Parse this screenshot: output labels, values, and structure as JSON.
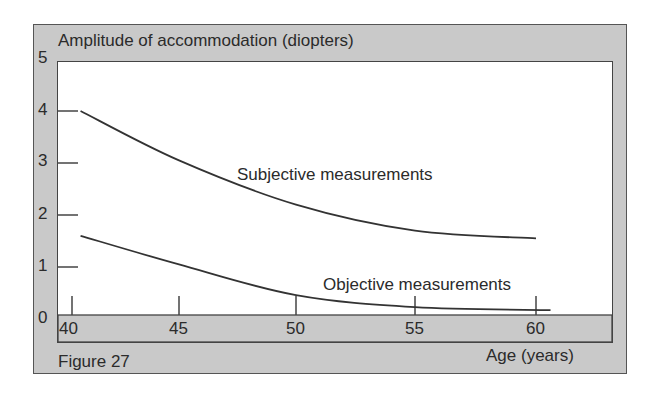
{
  "figure_label": "Figure 27",
  "colors": {
    "frame_gray": "#c9c9c9",
    "plot_white": "#ffffff",
    "ink": "#333333"
  },
  "chart_data": {
    "type": "line",
    "title": "Amplitude of accommodation (diopters)",
    "ylabel": "Amplitude of accommodation (diopters)",
    "xlabel": "Age (years)",
    "xlim": [
      40,
      62
    ],
    "ylim": [
      0,
      5
    ],
    "x_ticks": [
      40,
      45,
      50,
      55,
      60
    ],
    "y_ticks": [
      0,
      1,
      2,
      3,
      4,
      5
    ],
    "x_tick_labels": [
      "40",
      "45",
      "50",
      "55",
      "60"
    ],
    "y_tick_labels": [
      "0",
      "1",
      "2",
      "3",
      "4",
      "5"
    ],
    "grid": false,
    "legend": "inline annotations",
    "series": [
      {
        "name": "Subjective measurements",
        "x": [
          40.4,
          45,
          50,
          55,
          60
        ],
        "values": [
          4.0,
          3.05,
          2.2,
          1.7,
          1.55
        ]
      },
      {
        "name": "Objective measurements",
        "x": [
          40.4,
          45,
          50,
          55,
          60.6
        ],
        "values": [
          1.6,
          1.05,
          0.46,
          0.23,
          0.17
        ]
      }
    ],
    "annotations": [
      "Subjective measurements",
      "Objective measurements",
      "Figure 27"
    ]
  }
}
